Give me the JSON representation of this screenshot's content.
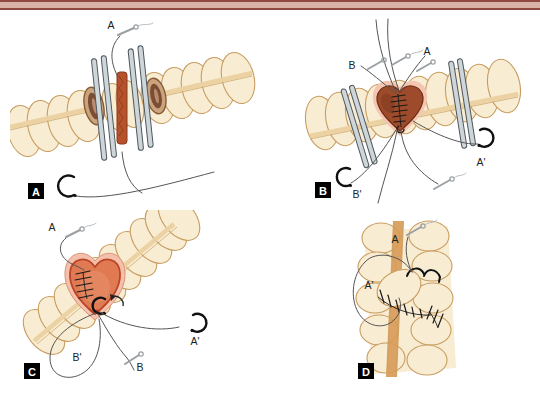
{
  "figure": {
    "type": "four-panel surgical illustration of bowel resection and hand-sewn anastomosis"
  },
  "panels": {
    "a": {
      "box_label": "A",
      "labels": {
        "suture_a": "A"
      }
    },
    "b": {
      "box_label": "B",
      "labels": {
        "suture_b": "B",
        "suture_a": "A",
        "suture_a_prime": "A'",
        "suture_b_prime": "B'"
      }
    },
    "c": {
      "box_label": "C",
      "labels": {
        "suture_a": "A",
        "suture_a_prime": "A'",
        "suture_b_prime": "B'",
        "suture_b": "B"
      }
    },
    "d": {
      "box_label": "D",
      "labels": {
        "suture_a": "A",
        "suture_a_prime": "A'"
      }
    }
  },
  "colors": {
    "page_bg": "#ffffff",
    "bar_fill": "#d9b2a8",
    "bar_border": "#8e4a42",
    "bowel_fill": "#f8ecd3",
    "bowel_outline": "#c89d60",
    "taenia_light": "#ecd2a2",
    "taenia_line": "#c9a163",
    "taenia_d": "#d79a56",
    "lumen_outer": "#c9a47c",
    "lumen_rim": "#8a5a38",
    "lumen_inner": "#7b4d35",
    "mesentery": "#b5522b",
    "mesentery_edge": "#8a3a1e",
    "clamp_fill": "#ced6d9",
    "clamp_edge": "#4f585e",
    "anastomosis_rim": "#f4c5b1",
    "anastomosis_b_fill": "#9d4b2a",
    "anastomosis_b_edge": "#6f3015",
    "anastomosis_c_rim": "#f4c0ab",
    "anastomosis_c_fill": "#e07a52",
    "anastomosis_c_edge": "#bb4527",
    "thread": "#555555",
    "needle_gray": "#9aa0a4",
    "needle_black": "#111111",
    "label_text": "#222222",
    "panel_box_bg": "#000000",
    "panel_box_text": "#ffffff"
  }
}
